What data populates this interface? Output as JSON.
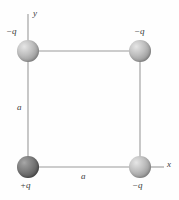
{
  "figure": {
    "background_color": "#fefefe",
    "line_color": "#9a9a9a",
    "label_color": "#3a3a3a",
    "charge_light_color": "#bdbdbd",
    "charge_dark_color": "#7d7d7d",
    "width": 179,
    "height": 200
  },
  "axes": {
    "y_label": "y",
    "x_label": "x"
  },
  "charges": [
    {
      "id": "top-left",
      "label": "−q",
      "sign": "negative",
      "shade": "light",
      "cx": 28,
      "cy": 51,
      "r": 11
    },
    {
      "id": "top-right",
      "label": "−q",
      "sign": "negative",
      "shade": "light",
      "cx": 140,
      "cy": 51,
      "r": 11
    },
    {
      "id": "bottom-left",
      "label": "+q",
      "sign": "positive",
      "shade": "dark",
      "cx": 28,
      "cy": 167,
      "r": 11
    },
    {
      "id": "bottom-right",
      "label": "−q",
      "sign": "negative",
      "shade": "light",
      "cx": 140,
      "cy": 167,
      "r": 11
    }
  ],
  "side_labels": {
    "left_side": "a",
    "bottom_side": "a"
  }
}
